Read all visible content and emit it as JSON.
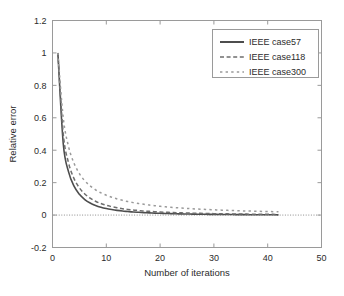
{
  "chart_data": {
    "type": "line",
    "title": "",
    "xlabel": "Number of iterations",
    "ylabel": "Relative error",
    "xlim": [
      0,
      50
    ],
    "ylim": [
      -0.2,
      1.2
    ],
    "xticks": [
      0,
      10,
      20,
      30,
      40,
      50
    ],
    "yticks": [
      -0.2,
      0,
      0.2,
      0.4,
      0.6,
      0.8,
      1,
      1.2
    ],
    "xtick_labels": [
      "0",
      "10",
      "20",
      "30",
      "40",
      "50"
    ],
    "ytick_labels": [
      "-0.2",
      "0",
      "0.2",
      "0.4",
      "0.6",
      "0.8",
      "1",
      "1.2"
    ],
    "grid": false,
    "legend_position": "upper right",
    "reference_lines": [
      {
        "name": "zero-line",
        "axis": "y",
        "value": 0,
        "style": "dotted",
        "color": "#8c8c8c"
      }
    ],
    "x": [
      1,
      2,
      3,
      4,
      5,
      6,
      7,
      8,
      9,
      10,
      11,
      12,
      13,
      14,
      15,
      16,
      17,
      18,
      19,
      20,
      21,
      22,
      23,
      24,
      25,
      26,
      27,
      28,
      29,
      30,
      31,
      32,
      33,
      34,
      35,
      36,
      37,
      38,
      39,
      40,
      41,
      42
    ],
    "series": [
      {
        "name": "IEEE case57",
        "style": "solid",
        "color": "#4d4d4d",
        "values": [
          1.0,
          0.44,
          0.265,
          0.178,
          0.128,
          0.096,
          0.074,
          0.059,
          0.048,
          0.04,
          0.034,
          0.029,
          0.025,
          0.022,
          0.019,
          0.017,
          0.015,
          0.0135,
          0.012,
          0.0108,
          0.0097,
          0.0088,
          0.008,
          0.0073,
          0.0066,
          0.006,
          0.0055,
          0.005,
          0.0046,
          0.0042,
          0.0039,
          0.0035,
          0.0032,
          0.003,
          0.0027,
          0.0025,
          0.0023,
          0.0021,
          0.0019,
          0.0018,
          0.0016,
          0.0015
        ]
      },
      {
        "name": "IEEE case118",
        "style": "dashed",
        "color": "#6e6e6e",
        "values": [
          1.0,
          0.5,
          0.32,
          0.225,
          0.168,
          0.13,
          0.104,
          0.085,
          0.071,
          0.06,
          0.052,
          0.045,
          0.039,
          0.035,
          0.031,
          0.028,
          0.025,
          0.023,
          0.021,
          0.019,
          0.0175,
          0.016,
          0.0148,
          0.0137,
          0.0127,
          0.0118,
          0.011,
          0.0102,
          0.0095,
          0.0089,
          0.0083,
          0.0078,
          0.0073,
          0.0068,
          0.0064,
          0.006,
          0.0056,
          0.0053,
          0.0049,
          0.0046,
          0.0043,
          0.004
        ]
      },
      {
        "name": "IEEE case300",
        "style": "dotted",
        "color": "#9a9a9a",
        "values": [
          1.0,
          0.6,
          0.42,
          0.32,
          0.256,
          0.212,
          0.18,
          0.156,
          0.137,
          0.122,
          0.11,
          0.0995,
          0.0908,
          0.0833,
          0.0768,
          0.0712,
          0.0662,
          0.0618,
          0.0579,
          0.0544,
          0.0512,
          0.0483,
          0.0457,
          0.0433,
          0.0411,
          0.0391,
          0.0372,
          0.0355,
          0.0339,
          0.0324,
          0.031,
          0.0297,
          0.0285,
          0.0273,
          0.0262,
          0.0252,
          0.0243,
          0.0234,
          0.0225,
          0.0217,
          0.021,
          0.0203
        ]
      }
    ],
    "legend": [
      {
        "label": "IEEE case57",
        "style": "solid",
        "color": "#4d4d4d"
      },
      {
        "label": "IEEE case118",
        "style": "dashed",
        "color": "#6e6e6e"
      },
      {
        "label": "IEEE case300",
        "style": "dotted",
        "color": "#9a9a9a"
      }
    ]
  },
  "figure": {
    "axis_color": "#9a9a9a",
    "text_color": "#2b2b2b",
    "background": "#ffffff"
  }
}
